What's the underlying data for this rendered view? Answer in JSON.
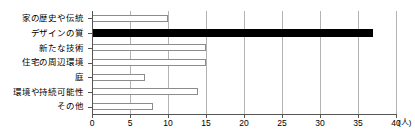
{
  "chart_data": {
    "type": "bar",
    "orientation": "horizontal",
    "title": "",
    "xlabel": "(人)",
    "ylabel": "",
    "xlim": [
      0,
      40
    ],
    "ylim": null,
    "grid": true,
    "legend": null,
    "x_ticks": [
      0,
      5,
      10,
      15,
      20,
      25,
      30,
      35,
      40
    ],
    "x_tick_labels": [
      "0",
      "5",
      "10",
      "15",
      "20",
      "25",
      "30",
      "35",
      "40"
    ],
    "unit": "(人)",
    "categories": [
      "家の歴史や伝統",
      "デザインの質",
      "新たな技術",
      "住宅の周辺環境",
      "庭",
      "環境や持続可能性",
      "その他"
    ],
    "values": [
      10,
      37,
      15,
      15,
      7,
      14,
      8
    ],
    "highlight_index": 1,
    "colors": {
      "bar_fill": "#ffffff",
      "bar_edge": "#8c8c8c",
      "highlight_fill": "#000000",
      "grid": "#b3b3b3",
      "axis": "#555555",
      "text": "#000000"
    }
  }
}
